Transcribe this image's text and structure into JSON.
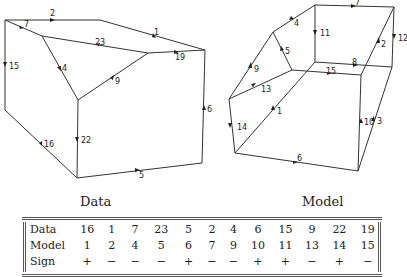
{
  "captions": {
    "left": "Data",
    "right": "Model"
  },
  "left_figure": {
    "edge_labels": [
      "2",
      "7",
      "23",
      "1",
      "19",
      "15",
      "4",
      "9",
      "6",
      "16",
      "22",
      "5"
    ]
  },
  "right_figure": {
    "edge_labels": [
      "7",
      "4",
      "11",
      "12",
      "2",
      "5",
      "9",
      "15",
      "8",
      "13",
      "1",
      "14",
      "10",
      "3",
      "6"
    ]
  },
  "table": {
    "rows": [
      {
        "header": "Data",
        "cells": [
          "16",
          "1",
          "7",
          "23",
          "5",
          "2",
          "4",
          "6",
          "15",
          "9",
          "22",
          "19"
        ]
      },
      {
        "header": "Model",
        "cells": [
          "1",
          "2",
          "4",
          "5",
          "6",
          "7",
          "9",
          "10",
          "11",
          "13",
          "14",
          "15"
        ]
      },
      {
        "header": "Sign",
        "cells": [
          "+",
          "−",
          "−",
          "−",
          "+",
          "−",
          "−",
          "+",
          "+",
          "−",
          "+",
          "−"
        ]
      }
    ]
  }
}
